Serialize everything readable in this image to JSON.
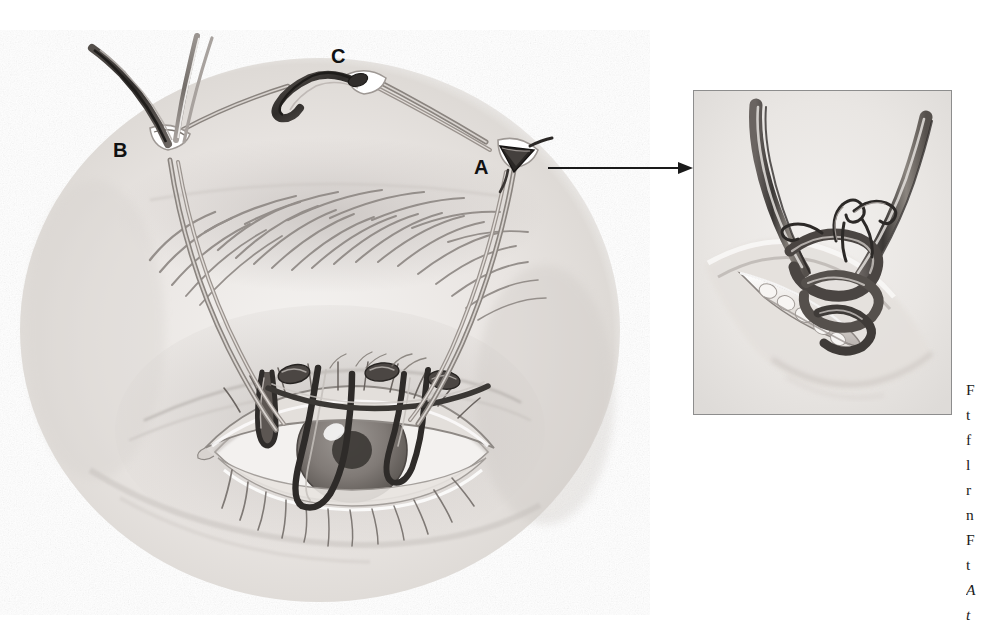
{
  "page": {
    "background_color": "#ffffff",
    "width": 986,
    "height": 615,
    "kind": "medical-illustration"
  },
  "figure": {
    "labels": [
      {
        "id": "A",
        "text": "A",
        "x": 483,
        "y": 167,
        "points_to": "lateral brow stab incision with suture emerging"
      },
      {
        "id": "B",
        "text": "B",
        "x": 120,
        "y": 150,
        "points_to": "medial brow stab incision with suture emerging"
      },
      {
        "id": "C",
        "text": "C",
        "x": 338,
        "y": 56,
        "points_to": "central supra-brow incision with suture loop"
      }
    ],
    "callout_arrow": {
      "name": "arrow-a-to-inset",
      "from_label": "A",
      "direction": "right",
      "x1": 548,
      "y1": 168,
      "x2": 688,
      "y2": 168,
      "color": "#1a1a1a"
    }
  },
  "inset": {
    "name": "detail-inset",
    "border_color": "#8d8d8d",
    "background_color": "#f3f3f1",
    "x": 693,
    "y": 90,
    "width": 259,
    "height": 325,
    "description": "Magnified view of incision A: the two free suture ends rise out of the wound and are tied together in a knot that is buried within the incision; the skin edges of the stab incision are retracted open."
  },
  "caption": {
    "clipped": true,
    "note": "Caption text runs off the right edge of the screenshot; only the first glyph of each line is visible.",
    "lines": [
      {
        "text": "F",
        "italic": false
      },
      {
        "text": "t",
        "italic": false
      },
      {
        "text": "f",
        "italic": false
      },
      {
        "text": "l",
        "italic": false
      },
      {
        "text": "",
        "italic": false
      },
      {
        "text": "r",
        "italic": false
      },
      {
        "text": "n",
        "italic": false
      },
      {
        "text": "F",
        "italic": false
      },
      {
        "text": "t",
        "italic": false
      },
      {
        "text": "A",
        "italic": true
      },
      {
        "text": "t",
        "italic": true
      }
    ]
  },
  "colors": {
    "ink_dark": "#2b2b2b",
    "ink_mid": "#6f6f6f",
    "ink_light": "#b9b9b9",
    "skin_base": "#efecea",
    "skin_shadow": "#d2cecb",
    "suture_dark": "#3a3735",
    "suture_highlight": "#cfcac5",
    "label_color": "#111111",
    "inset_border": "#8d8d8d"
  }
}
